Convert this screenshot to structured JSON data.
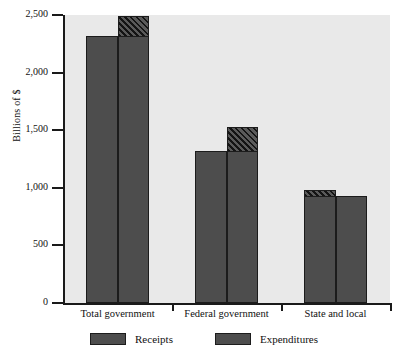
{
  "chart_data": {
    "type": "bar",
    "title": "",
    "xlabel": "",
    "ylabel": "Billions of $",
    "categories": [
      "Total government",
      "Federal government",
      "State and local"
    ],
    "series": [
      {
        "name": "Receipts",
        "values": [
          2320,
          1320,
          980
        ]
      },
      {
        "name": "Expenditures",
        "values": [
          2490,
          1530,
          930
        ]
      }
    ],
    "ylim": [
      0,
      2500
    ],
    "yticks": [
      0,
      500,
      1000,
      1500,
      2000,
      2500
    ],
    "ytick_labels": [
      "0",
      "500",
      "1,000",
      "1,500",
      "2,000",
      "2,500"
    ],
    "grid": false,
    "legend_position": "bottom",
    "bar_color": "#4d4d4d",
    "plot_background": "#e9e9e9",
    "axis_color": "#1a1a1a",
    "hatch_note": "Diagonal-hatched band marks the top segment of the taller bar in each pair (gap between receipts and expenditures).",
    "hatched_segments": [
      {
        "category": "Total government",
        "series": "Expenditures",
        "from": 2320,
        "to": 2490
      },
      {
        "category": "Federal government",
        "series": "Expenditures",
        "from": 1320,
        "to": 1530
      },
      {
        "category": "State and local",
        "series": "Receipts",
        "from": 930,
        "to": 980
      }
    ]
  },
  "legend": {
    "items": [
      {
        "label": "Receipts"
      },
      {
        "label": "Expenditures"
      }
    ]
  }
}
